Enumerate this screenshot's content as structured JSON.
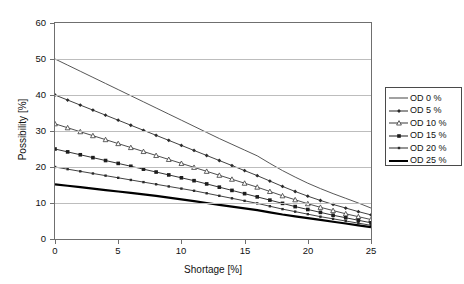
{
  "chart_data": {
    "type": "line",
    "title": "",
    "xlabel": "Shortage [%]",
    "ylabel": "Possibility [%]",
    "xlim": [
      0,
      25
    ],
    "ylim": [
      0,
      60
    ],
    "xticks": [
      0,
      5,
      10,
      15,
      20,
      25
    ],
    "yticks": [
      0,
      10,
      20,
      30,
      40,
      50,
      60
    ],
    "grid": "horizontal",
    "legend_position": "right",
    "x": [
      0,
      1,
      2,
      3,
      4,
      5,
      6,
      7,
      8,
      9,
      10,
      11,
      12,
      13,
      14,
      15,
      16,
      17,
      18,
      19,
      20,
      21,
      22,
      23,
      24,
      25
    ],
    "series": [
      {
        "name": "OD 0 %",
        "marker": "none",
        "line_width": 0.9,
        "color": "#444444",
        "values": [
          50.0,
          48.3,
          46.6,
          44.9,
          43.2,
          41.5,
          39.8,
          38.1,
          36.4,
          34.7,
          33.0,
          31.3,
          29.6,
          27.9,
          26.3,
          24.7,
          23.1,
          21.0,
          19.0,
          17.2,
          15.5,
          14.0,
          12.6,
          11.3,
          10.0,
          8.6
        ]
      },
      {
        "name": "OD 5 %",
        "marker": "diamond-filled",
        "line_width": 0.9,
        "color": "#2b2b2b",
        "values": [
          40.0,
          38.6,
          37.2,
          35.8,
          34.4,
          33.0,
          31.6,
          30.2,
          28.8,
          27.4,
          26.0,
          24.6,
          23.2,
          21.8,
          20.4,
          19.0,
          17.6,
          16.1,
          14.6,
          13.2,
          11.9,
          10.7,
          9.6,
          8.6,
          7.6,
          6.7
        ]
      },
      {
        "name": "OD 10 %",
        "marker": "triangle-open",
        "line_width": 0.9,
        "color": "#3a3a3a",
        "values": [
          32.0,
          30.9,
          29.8,
          28.7,
          27.6,
          26.5,
          25.4,
          24.3,
          23.2,
          22.1,
          21.0,
          19.9,
          18.8,
          17.7,
          16.6,
          15.5,
          14.4,
          13.2,
          12.0,
          10.9,
          9.8,
          8.8,
          7.9,
          7.0,
          6.2,
          5.4
        ]
      },
      {
        "name": "OD 15 %",
        "marker": "square-filled-large",
        "line_width": 0.9,
        "color": "#1d1d1d",
        "values": [
          25.0,
          24.2,
          23.4,
          22.6,
          21.8,
          21.0,
          20.2,
          19.4,
          18.6,
          17.8,
          17.0,
          16.2,
          15.3,
          14.4,
          13.5,
          12.6,
          11.7,
          10.8,
          9.9,
          9.0,
          8.2,
          7.4,
          6.6,
          5.9,
          5.2,
          4.5
        ]
      },
      {
        "name": "OD 20 %",
        "marker": "square-filled-small",
        "line_width": 0.9,
        "color": "#2b2b2b",
        "values": [
          20.0,
          19.4,
          18.8,
          18.2,
          17.6,
          17.0,
          16.4,
          15.8,
          15.2,
          14.6,
          14.0,
          13.4,
          12.7,
          12.0,
          11.3,
          10.6,
          9.9,
          9.1,
          8.3,
          7.6,
          6.9,
          6.2,
          5.6,
          5.0,
          4.4,
          3.8
        ]
      },
      {
        "name": "OD 25 %",
        "marker": "none",
        "line_width": 2.2,
        "color": "#000000",
        "values": [
          15.2,
          14.8,
          14.4,
          14.0,
          13.6,
          13.2,
          12.8,
          12.4,
          12.0,
          11.5,
          11.0,
          10.5,
          10.0,
          9.5,
          9.0,
          8.5,
          8.0,
          7.4,
          6.8,
          6.3,
          5.8,
          5.3,
          4.8,
          4.3,
          3.8,
          3.3
        ]
      }
    ]
  },
  "axes": {
    "x_tick_labels": [
      "0",
      "5",
      "10",
      "15",
      "20",
      "25"
    ],
    "y_tick_labels": [
      "0",
      "10",
      "20",
      "30",
      "40",
      "50",
      "60"
    ],
    "x_title": "Shortage [%]",
    "y_title": "Possibility [%]"
  },
  "legend": {
    "items": [
      {
        "label": "OD 0 %"
      },
      {
        "label": "OD 5 %"
      },
      {
        "label": "OD 10 %"
      },
      {
        "label": "OD 15 %"
      },
      {
        "label": "OD 20 %"
      },
      {
        "label": "OD 25 %"
      }
    ]
  },
  "colors": {
    "grid": "#bdbdbd",
    "frame": "#6f6f6f",
    "text": "#111111"
  }
}
